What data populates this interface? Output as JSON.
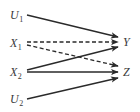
{
  "diagram": {
    "type": "causal-graph",
    "nodes": [
      {
        "id": "U1",
        "letter": "U",
        "sub": "1",
        "x": 10,
        "y": 19
      },
      {
        "id": "X1",
        "letter": "X",
        "sub": "1",
        "x": 10,
        "y": 47
      },
      {
        "id": "X2",
        "letter": "X",
        "sub": "2",
        "x": 10,
        "y": 76
      },
      {
        "id": "U2",
        "letter": "U",
        "sub": "2",
        "x": 10,
        "y": 103
      },
      {
        "id": "Y",
        "letter": "Y",
        "sub": "",
        "x": 123,
        "y": 46
      },
      {
        "id": "Z",
        "letter": "Z",
        "sub": "",
        "x": 123,
        "y": 76
      }
    ],
    "edges": [
      {
        "from": "U1",
        "to": "Y",
        "style": "solid",
        "x1": 27,
        "y1": 15,
        "x2": 118,
        "y2": 37
      },
      {
        "from": "X1",
        "to": "Y",
        "style": "dashed",
        "x1": 27,
        "y1": 42,
        "x2": 118,
        "y2": 42
      },
      {
        "from": "X1",
        "to": "Z",
        "style": "dashed",
        "x1": 27,
        "y1": 45,
        "x2": 118,
        "y2": 66
      },
      {
        "from": "X2",
        "to": "Y",
        "style": "solid",
        "x1": 27,
        "y1": 70,
        "x2": 118,
        "y2": 47
      },
      {
        "from": "X2",
        "to": "Z",
        "style": "solid",
        "x1": 27,
        "y1": 72,
        "x2": 118,
        "y2": 72
      },
      {
        "from": "U2",
        "to": "Z",
        "style": "solid",
        "x1": 27,
        "y1": 99,
        "x2": 118,
        "y2": 78
      }
    ]
  }
}
